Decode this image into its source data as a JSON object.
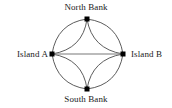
{
  "diagram": {
    "type": "multigraph",
    "width": 172,
    "height": 108,
    "background_color": "#ffffff",
    "edge_color": "#4a4a4a",
    "straight_edge_color": "#787878",
    "node_color": "#000000",
    "label_color": "#1a1a1a",
    "nodes": [
      {
        "id": "north",
        "label": "North Bank",
        "x": 87,
        "y": 19
      },
      {
        "id": "west",
        "label": "Island A",
        "x": 52,
        "y": 54
      },
      {
        "id": "east",
        "label": "Island B",
        "x": 123,
        "y": 54
      },
      {
        "id": "south",
        "label": "South Bank",
        "x": 87,
        "y": 89
      }
    ],
    "edges": [
      {
        "from": "west",
        "to": "north",
        "style": "curved",
        "bow": "outer"
      },
      {
        "from": "west",
        "to": "north",
        "style": "curved",
        "bow": "inner"
      },
      {
        "from": "north",
        "to": "east",
        "style": "curved",
        "bow": "outer"
      },
      {
        "from": "north",
        "to": "east",
        "style": "curved",
        "bow": "inner"
      },
      {
        "from": "west",
        "to": "south",
        "style": "curved",
        "bow": "outer"
      },
      {
        "from": "west",
        "to": "south",
        "style": "curved",
        "bow": "inner"
      },
      {
        "from": "south",
        "to": "east",
        "style": "curved",
        "bow": "outer"
      },
      {
        "from": "south",
        "to": "east",
        "style": "curved",
        "bow": "inner"
      },
      {
        "from": "west",
        "to": "east",
        "style": "straight",
        "bow": "none"
      }
    ],
    "edge_count": 9,
    "node_count": 4
  }
}
